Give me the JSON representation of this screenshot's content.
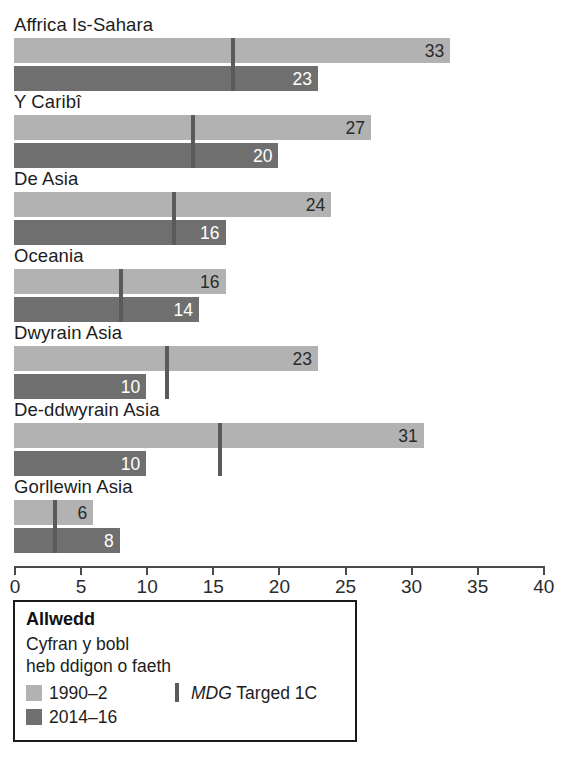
{
  "chart_data": {
    "type": "bar",
    "orientation": "horizontal",
    "title": "",
    "xlabel": "",
    "ylabel": "",
    "xlim": [
      0,
      40
    ],
    "grid": false,
    "categories": [
      "Affrica Is-Sahara",
      "Y Caribî",
      "De Asia",
      "Oceania",
      "Dwyrain Asia",
      "De-ddwyrain Asia",
      "Gorllewin Asia"
    ],
    "series": [
      {
        "name": "1990–2",
        "color": "#b2b2b2",
        "values": [
          33,
          27,
          24,
          16,
          23,
          31,
          6
        ]
      },
      {
        "name": "2014–16",
        "color": "#6f6f6f",
        "values": [
          23,
          20,
          16,
          14,
          10,
          10,
          8
        ]
      }
    ],
    "markers": {
      "name": "MDG Targed 1C",
      "color": "#5a5a5a",
      "values": [
        16.5,
        13.5,
        12,
        8,
        11.5,
        15.5,
        3
      ]
    },
    "tick_labels": [
      "0",
      "5",
      "10",
      "15",
      "20",
      "25",
      "30",
      "35",
      "40"
    ],
    "tick_values": [
      0,
      5,
      10,
      15,
      20,
      25,
      30,
      35,
      40
    ]
  },
  "legend": {
    "title": "Allwedd",
    "subtitle_line1": "Cyfran y bobl",
    "subtitle_line2": "heb ddigon o faeth",
    "item_old": "1990–2",
    "item_new": "2014–16",
    "marker_label_italic": "MDG",
    "marker_label_rest": " Targed 1C"
  }
}
